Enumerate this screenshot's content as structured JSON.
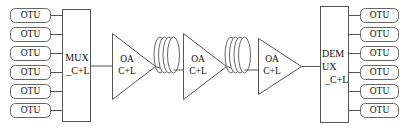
{
  "diagram": {
    "colors": {
      "line": "#555555",
      "box_border": "#666666",
      "background": "#ffffff",
      "text": "#111111"
    },
    "transmit_side": {
      "otus": [
        {
          "label": "OTU"
        },
        {
          "label": "OTU"
        },
        {
          "label": "OTU"
        },
        {
          "label": "OTU"
        },
        {
          "label": "OTU"
        },
        {
          "label": "OTU"
        }
      ],
      "multiplexer": {
        "line1": "MUX",
        "line2": "_C+L"
      }
    },
    "link": {
      "amplifiers": [
        {
          "line1": "OA",
          "line2": "C+L"
        },
        {
          "line1": "OA",
          "line2": "C+L"
        },
        {
          "line1": "OA",
          "line2": "C+L"
        }
      ],
      "fiber_spools": [
        {
          "name": "fiber-spool-1"
        },
        {
          "name": "fiber-spool-2"
        }
      ]
    },
    "receive_side": {
      "demultiplexer": {
        "line1": "DEM",
        "line2": "UX",
        "line3": "_C+L"
      },
      "otus": [
        {
          "label": "OTU"
        },
        {
          "label": "OTU"
        },
        {
          "label": "OTU"
        },
        {
          "label": "OTU"
        },
        {
          "label": "OTU"
        },
        {
          "label": "OTU"
        }
      ]
    }
  }
}
